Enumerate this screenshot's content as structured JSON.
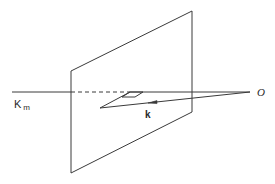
{
  "diagram": {
    "type": "geometric-ray-plane",
    "colors": {
      "stroke": "#3a3a3a",
      "background": "#ffffff"
    },
    "labels": {
      "axis": "K",
      "axis_subscript": "m",
      "origin": "O",
      "vector": "k"
    },
    "plane": {
      "points": [
        [
          71,
          71
        ],
        [
          192,
          11
        ],
        [
          192,
          112
        ],
        [
          71,
          173
        ]
      ]
    },
    "axis_line": {
      "solid_start": [
        12,
        92
      ],
      "solid_end": [
        71,
        92
      ],
      "dashed_end": [
        130,
        92
      ],
      "origin": [
        250,
        92
      ]
    },
    "vector_triangle": {
      "origin": [
        250,
        92
      ],
      "apex": [
        100,
        108
      ],
      "arrow_at": [
        152,
        102.5
      ]
    },
    "right_angle_marker": {
      "points": [
        [
          130,
          92
        ],
        [
          143,
          92
        ],
        [
          135,
          97
        ],
        [
          122,
          97
        ]
      ]
    }
  }
}
